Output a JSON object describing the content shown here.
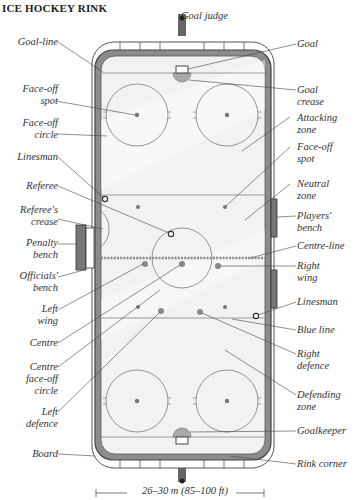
{
  "title": "ICE HOCKEY RINK",
  "labels_left": [
    {
      "id": "goal-line",
      "text": "Goal-line",
      "x": 10,
      "y": 36,
      "w": 46
    },
    {
      "id": "face-off-spot",
      "text": "Face-off\nspot",
      "x": 10,
      "y": 83,
      "w": 46
    },
    {
      "id": "face-off-circle",
      "text": "Face-off\ncircle",
      "x": 10,
      "y": 117,
      "w": 46
    },
    {
      "id": "linesman-left",
      "text": "Linesman",
      "x": 4,
      "y": 151,
      "w": 52
    },
    {
      "id": "referee",
      "text": "Referee",
      "x": 4,
      "y": 180,
      "w": 52
    },
    {
      "id": "referees-crease",
      "text": "Referee's\ncrease",
      "x": 4,
      "y": 204,
      "w": 52
    },
    {
      "id": "penalty-bench",
      "text": "Penalty\nbench",
      "x": 4,
      "y": 237,
      "w": 52
    },
    {
      "id": "officials-bench",
      "text": "Officials'\nbench",
      "x": 4,
      "y": 270,
      "w": 52
    },
    {
      "id": "left-wing",
      "text": "Left\nwing",
      "x": 4,
      "y": 303,
      "w": 52
    },
    {
      "id": "centre",
      "text": "Centre",
      "x": 4,
      "y": 337,
      "w": 52
    },
    {
      "id": "centre-face-off-circle",
      "text": "Centre\nface-off\ncircle",
      "x": 4,
      "y": 361,
      "w": 52
    },
    {
      "id": "left-defence",
      "text": "Left\ndefence",
      "x": 4,
      "y": 406,
      "w": 52
    },
    {
      "id": "board",
      "text": "Board",
      "x": 4,
      "y": 448,
      "w": 52
    }
  ],
  "labels_right": [
    {
      "id": "goal-judge",
      "text": "Goal judge",
      "x": 181,
      "y": 10
    },
    {
      "id": "goal",
      "text": "Goal",
      "x": 297,
      "y": 38
    },
    {
      "id": "goal-crease",
      "text": "Goal\ncrease",
      "x": 297,
      "y": 84
    },
    {
      "id": "attacking-zone",
      "text": "Attacking\nzone",
      "x": 297,
      "y": 112
    },
    {
      "id": "face-off-spot-right",
      "text": "Face-off\nspot",
      "x": 297,
      "y": 141
    },
    {
      "id": "neutral-zone",
      "text": "Neutral\nzone",
      "x": 297,
      "y": 178
    },
    {
      "id": "players-bench",
      "text": "Players'\nbench",
      "x": 297,
      "y": 210
    },
    {
      "id": "centre-line",
      "text": "Centre-line",
      "x": 297,
      "y": 240
    },
    {
      "id": "right-wing",
      "text": "Right\nwing",
      "x": 297,
      "y": 260
    },
    {
      "id": "linesman-right",
      "text": "Linesman",
      "x": 297,
      "y": 296
    },
    {
      "id": "blue-line",
      "text": "Blue line",
      "x": 297,
      "y": 324
    },
    {
      "id": "right-defence",
      "text": "Right\ndefence",
      "x": 297,
      "y": 348
    },
    {
      "id": "defending-zone",
      "text": "Defending\nzone",
      "x": 297,
      "y": 389
    },
    {
      "id": "goalkeeper",
      "text": "Goalkeeper",
      "x": 297,
      "y": 425
    },
    {
      "id": "rink-corner",
      "text": "Rink corner",
      "x": 297,
      "y": 458
    }
  ],
  "measurement": "26–30 m (85–100 ft)",
  "colors": {
    "ice": "#f2f2f2",
    "board": "#8c8c8c",
    "board_dark": "#555555",
    "line": "#777777",
    "spot": "#777777",
    "text": "#333333"
  }
}
